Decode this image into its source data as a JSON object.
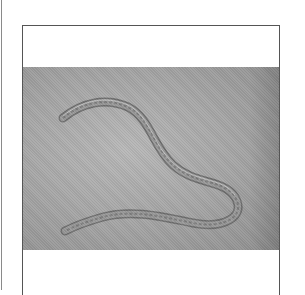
{
  "image": {
    "subject": "nematode-micrograph",
    "colors": {
      "frame_border": "#555555",
      "background_gray": "#a8a8a8",
      "worm_outline": "#6a6a6a",
      "worm_highlight": "#d4d4d4"
    }
  }
}
